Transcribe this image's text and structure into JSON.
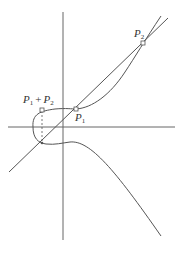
{
  "figure": {
    "colors": {
      "stroke": "#555555",
      "background": "#ffffff",
      "label": "#333333"
    },
    "axes": {
      "x_axis": {
        "x1": 8,
        "y1": 127,
        "x2": 175,
        "y2": 127
      },
      "y_axis": {
        "x1": 63,
        "y1": 12,
        "x2": 63,
        "y2": 240
      }
    },
    "points": [
      {
        "id": "P1",
        "label": "P",
        "subscript": "1",
        "x": 76,
        "y": 109,
        "label_x": 76,
        "label_y": 120
      },
      {
        "id": "P2",
        "label": "P",
        "subscript": "2",
        "x": 143,
        "y": 43,
        "label_x": 135,
        "label_y": 37
      },
      {
        "id": "P1_plus_P2",
        "label": "P",
        "subscript": "1",
        "plus": "+",
        "label2": "P",
        "subscript2": "2",
        "x": 42,
        "y": 110,
        "label_x": 24,
        "label_y": 103
      },
      {
        "id": "reflection",
        "x": 42,
        "y": 143
      }
    ],
    "labels": {
      "p1": "P",
      "p1_sub": "1",
      "p2": "P",
      "p2_sub": "2",
      "sum_a": "P",
      "sum_a_sub": "1",
      "sum_plus": "+",
      "sum_b": "P",
      "sum_b_sub": "2"
    }
  }
}
